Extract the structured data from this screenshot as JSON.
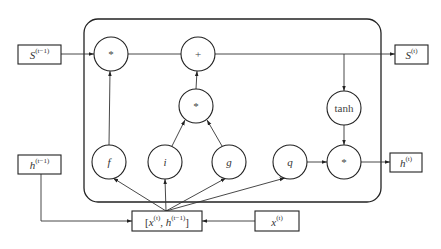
{
  "inputs": {
    "state_prev": {
      "base": "S",
      "sup": "(t−1)"
    },
    "hidden_prev": {
      "base": "h",
      "sup": "(t−1)"
    },
    "x_t": {
      "base": "x",
      "sup": "(t)"
    },
    "concat": {
      "open": "[",
      "x": "x",
      "x_sup": "(t)",
      "sep": ", ",
      "h": "h",
      "h_sup": "(t−1)",
      "close": "]"
    }
  },
  "outputs": {
    "state": {
      "base": "S",
      "sup": "(t)"
    },
    "hidden": {
      "base": "h",
      "sup": "(t)"
    }
  },
  "nodes": {
    "forget_mult": "*",
    "add": "+",
    "input_mult": "*",
    "tanh": "tanh",
    "output_mult": "*",
    "f": "f",
    "i": "i",
    "g": "g",
    "q": "q"
  }
}
